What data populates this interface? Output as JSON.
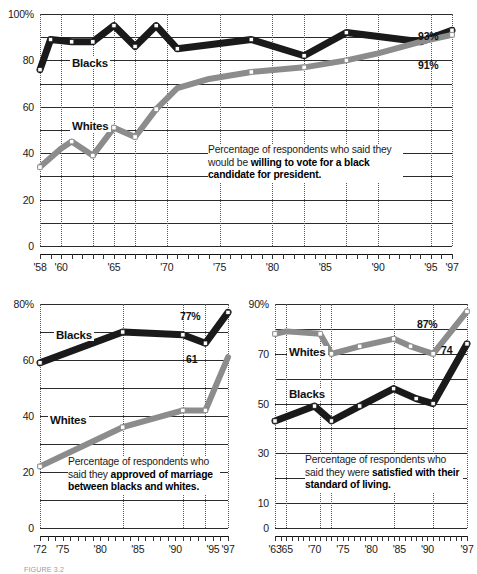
{
  "figure": {
    "caption_note": "FIGURE 3.2"
  },
  "chart_data": [
    {
      "id": "vote-black-president",
      "type": "line",
      "title": "",
      "caption_plain": "Percentage of respondents who said they would be ",
      "caption_bold": "willing to vote for a black candidate for president.",
      "xlabel": "",
      "ylabel": "",
      "ylim": [
        0,
        100
      ],
      "yticks": [
        0,
        20,
        40,
        60,
        80,
        100
      ],
      "ytick_labels": [
        "0",
        "20",
        "40",
        "60",
        "80",
        "100%"
      ],
      "xlim": [
        1958,
        1997
      ],
      "xticks": [
        1958,
        1960,
        1965,
        1970,
        1975,
        1980,
        1985,
        1990,
        1995,
        1997
      ],
      "xtick_labels": [
        "'58",
        "'60",
        "'65",
        "'70",
        "'75",
        "'80",
        "'85",
        "'90",
        "'95",
        "'97"
      ],
      "grid": true,
      "legend_position": "inline",
      "series": [
        {
          "name": "Blacks",
          "color": "#1a1a1a",
          "end_label": "93%",
          "x": [
            1958,
            1959,
            1961,
            1963,
            1965,
            1967,
            1969,
            1971,
            1978,
            1983,
            1987,
            1994,
            1997
          ],
          "values": [
            76,
            89,
            88,
            88,
            95,
            86,
            95,
            85,
            89,
            82,
            92,
            88,
            93
          ]
        },
        {
          "name": "Whites",
          "color": "#8c8c8c",
          "end_label": "91%",
          "x": [
            1958,
            1960,
            1961,
            1963,
            1965,
            1967,
            1969,
            1971,
            1974,
            1978,
            1983,
            1987,
            1990,
            1994,
            1997
          ],
          "values": [
            34,
            42,
            45,
            39,
            51,
            47,
            59,
            68,
            72,
            75,
            77,
            80,
            83,
            88,
            91
          ]
        }
      ]
    },
    {
      "id": "approve-interracial-marriage",
      "type": "line",
      "title": "",
      "caption_plain": "Percentage of respondents who said they ",
      "caption_bold": "approved of marriage between blacks and whites.",
      "xlabel": "",
      "ylabel": "",
      "ylim": [
        0,
        80
      ],
      "yticks": [
        0,
        20,
        40,
        60,
        80
      ],
      "ytick_labels": [
        "0",
        "20",
        "40",
        "60",
        "80%"
      ],
      "xlim": [
        1972,
        1997
      ],
      "xticks": [
        1972,
        1975,
        1980,
        1985,
        1990,
        1995,
        1997
      ],
      "xtick_labels": [
        "'72",
        "'75",
        "'80",
        "'85",
        "'90",
        "'95",
        "'97"
      ],
      "grid": true,
      "legend_position": "inline",
      "series": [
        {
          "name": "Blacks",
          "color": "#1a1a1a",
          "end_label": "77%",
          "x": [
            1972,
            1983,
            1991,
            1994,
            1997
          ],
          "values": [
            59,
            70,
            69,
            66,
            77
          ]
        },
        {
          "name": "Whites",
          "color": "#8c8c8c",
          "end_label": "61",
          "x": [
            1972,
            1983,
            1991,
            1994,
            1997
          ],
          "values": [
            22,
            36,
            42,
            42,
            61
          ]
        }
      ]
    },
    {
      "id": "satisfied-standard-of-living",
      "type": "line",
      "title": "",
      "caption_plain": "Percentage of respondents who said they were ",
      "caption_bold": "satisfied with their standard of living.",
      "xlabel": "",
      "ylabel": "",
      "ylim": [
        0,
        90
      ],
      "yticks": [
        0,
        10,
        30,
        50,
        70,
        90
      ],
      "ytick_labels": [
        "0",
        "10",
        "30",
        "50",
        "70",
        "90%"
      ],
      "xlim": [
        1963,
        1997
      ],
      "xticks": [
        1963,
        1965,
        1970,
        1975,
        1980,
        1985,
        1990,
        1997
      ],
      "xtick_labels": [
        "'63",
        "'65",
        "'70",
        "'75",
        "'80",
        "'85",
        "'90",
        "'97"
      ],
      "grid": true,
      "legend_position": "inline",
      "series": [
        {
          "name": "Whites",
          "color": "#8c8c8c",
          "end_label": "87%",
          "x": [
            1963,
            1965,
            1971,
            1973,
            1978,
            1984,
            1987,
            1991,
            1997
          ],
          "values": [
            78,
            79,
            78,
            70,
            73,
            76,
            73,
            70,
            87
          ]
        },
        {
          "name": "Blacks",
          "color": "#1a1a1a",
          "end_label": "74",
          "x": [
            1963,
            1970,
            1973,
            1978,
            1984,
            1988,
            1991,
            1997
          ],
          "values": [
            43,
            49,
            43,
            49,
            56,
            52,
            50,
            74
          ]
        }
      ]
    }
  ]
}
